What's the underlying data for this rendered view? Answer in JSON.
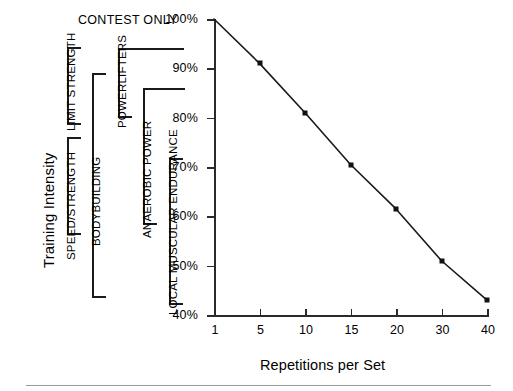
{
  "figure": {
    "background": "#ffffff",
    "ink_color": "#111111",
    "axis_color": "#2a2a2a",
    "rule_color": "#9a9a9a"
  },
  "axes": {
    "y_title": "Training Intensity",
    "x_title": "Repetitions per Set",
    "y_tick_labels": [
      "100%",
      "90%",
      "80%",
      "70%",
      "60%",
      "50%",
      "40%"
    ],
    "x_tick_labels": [
      "1",
      "5",
      "10",
      "15",
      "20",
      "30",
      "40"
    ]
  },
  "annotations": {
    "contest_only": "CONTEST ONLY"
  },
  "brackets": [
    {
      "id": "limit-strength",
      "label": "LIMIT STRENGTH"
    },
    {
      "id": "speed-strength",
      "label": "SPEED/STRENGTH"
    },
    {
      "id": "bodybuilding",
      "label": "BODYBUILDING"
    },
    {
      "id": "powerlifters",
      "label": "POWERLIFTERS"
    },
    {
      "id": "anaerobic-power",
      "label": "ANAEROBIC POWER"
    },
    {
      "id": "local-muscular-endurance",
      "label": "LOCAL MUSCULAR ENDURANCE"
    }
  ],
  "chart_data": {
    "type": "line",
    "title": "",
    "xlabel": "Repetitions per Set",
    "ylabel": "Training Intensity",
    "x": [
      1,
      5,
      10,
      15,
      20,
      30,
      40
    ],
    "x_tick_labels": [
      "1",
      "5",
      "10",
      "15",
      "20",
      "30",
      "40"
    ],
    "x_scale": "ordinal",
    "values": [
      100,
      91,
      81,
      70.5,
      61.5,
      51,
      43
    ],
    "y_unit": "%",
    "ylim": [
      40,
      100
    ],
    "y_ticks": [
      40,
      50,
      60,
      70,
      80,
      90,
      100
    ],
    "grid": false,
    "legend": "none",
    "marker": "square",
    "markers_shown_at_x": [
      5,
      10,
      15,
      20,
      30,
      40
    ],
    "series": [
      {
        "name": "Training Intensity (% of 1RM)",
        "values": [
          100,
          91,
          81,
          70.5,
          61.5,
          51,
          43
        ]
      }
    ],
    "annotations": [
      {
        "text": "CONTEST ONLY",
        "y_range": [
          100,
          100
        ]
      },
      {
        "text": "POWERLIFTERS",
        "y_range": [
          80,
          97
        ]
      },
      {
        "text": "ANAEROBIC POWER",
        "y_range": [
          55,
          87
        ]
      },
      {
        "text": "LOCAL MUSCULAR ENDURANCE",
        "y_range": [
          40,
          70
        ]
      },
      {
        "text": "LIMIT STRENGTH",
        "y_range": [
          82,
          99
        ]
      },
      {
        "text": "SPEED/STRENGTH",
        "y_range": [
          62,
          80
        ]
      },
      {
        "text": "BODYBUILDING",
        "y_range": [
          41,
          94
        ]
      }
    ]
  }
}
